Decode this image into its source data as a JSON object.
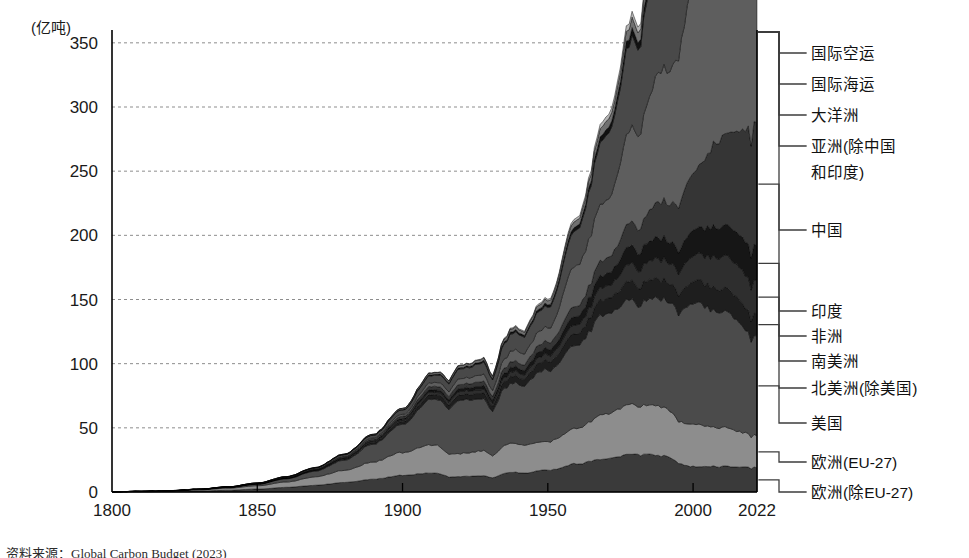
{
  "figure": {
    "unit_label": "(亿吨)",
    "source_note": "资料来源：Global Carbon Budget (2023)"
  },
  "chart_data": {
    "type": "area",
    "title": "",
    "subtitle": "",
    "xlabel": "",
    "ylabel": "",
    "unit": "亿吨",
    "grid": true,
    "stacked": true,
    "legend_position": "right",
    "xlim": [
      1800,
      2022
    ],
    "ylim": [
      0,
      360
    ],
    "ytick_values": [
      0,
      50,
      100,
      150,
      200,
      250,
      300,
      350
    ],
    "ytick_labels": [
      "0",
      "50",
      "100",
      "150",
      "200",
      "250",
      "300",
      "350"
    ],
    "xtick_values": [
      1800,
      1850,
      1900,
      1950,
      2000,
      2022
    ],
    "xtick_labels": [
      "1800",
      "1850",
      "1900",
      "1950",
      "2000",
      "2022"
    ],
    "x": [
      1800,
      1810,
      1820,
      1830,
      1840,
      1850,
      1860,
      1870,
      1880,
      1890,
      1900,
      1910,
      1920,
      1930,
      1940,
      1950,
      1960,
      1970,
      1980,
      1990,
      2000,
      2010,
      2022
    ],
    "series": [
      {
        "name": "欧洲(除EU-27)",
        "color": "#3a3a3a",
        "values": [
          0.1,
          0.2,
          0.4,
          0.8,
          1.4,
          2.3,
          3.6,
          5.2,
          7.5,
          10.0,
          13.0,
          15.0,
          12.0,
          13.0,
          15.5,
          17.0,
          22.0,
          26.0,
          30.0,
          28.0,
          20.0,
          20.0,
          19.0
        ]
      },
      {
        "name": "欧洲(EU-27)",
        "color": "#8d8d8d",
        "values": [
          0.1,
          0.2,
          0.4,
          0.9,
          1.6,
          2.6,
          4.2,
          6.5,
          9.5,
          13.5,
          18.0,
          22.0,
          18.0,
          20.0,
          23.0,
          22.0,
          28.0,
          35.0,
          39.0,
          38.0,
          33.0,
          30.0,
          25.0
        ]
      },
      {
        "name": "美国",
        "color": "#4b4b4b",
        "values": [
          0.0,
          0.1,
          0.2,
          0.3,
          0.6,
          1.2,
          2.5,
          4.5,
          8.0,
          14.0,
          22.0,
          35.0,
          42.0,
          40.0,
          48.0,
          56.0,
          65.0,
          78.0,
          82.0,
          85.0,
          95.0,
          90.0,
          78.0
        ]
      },
      {
        "name": "北美洲(除美国)",
        "color": "#1e1e1e",
        "values": [
          0.0,
          0.0,
          0.0,
          0.1,
          0.1,
          0.2,
          0.3,
          0.5,
          0.9,
          1.4,
          2.2,
          3.5,
          4.2,
          4.5,
          5.5,
          7.0,
          9.0,
          12.0,
          14.5,
          15.0,
          17.0,
          18.0,
          17.0
        ]
      },
      {
        "name": "南美洲",
        "color": "#2e2e2e",
        "values": [
          0.0,
          0.0,
          0.0,
          0.0,
          0.1,
          0.1,
          0.2,
          0.3,
          0.5,
          0.8,
          1.2,
          2.0,
          2.6,
          3.0,
          3.8,
          5.0,
          7.0,
          10.0,
          14.0,
          16.0,
          20.0,
          25.0,
          26.0
        ]
      },
      {
        "name": "非洲",
        "color": "#161616",
        "values": [
          0.0,
          0.0,
          0.0,
          0.0,
          0.0,
          0.1,
          0.1,
          0.2,
          0.4,
          0.7,
          1.1,
          1.8,
          2.3,
          2.8,
          3.5,
          4.5,
          6.5,
          9.5,
          14.0,
          16.5,
          20.0,
          24.0,
          27.0
        ]
      },
      {
        "name": "印度",
        "color": "#353535",
        "values": [
          0.0,
          0.0,
          0.0,
          0.0,
          0.1,
          0.1,
          0.2,
          0.4,
          0.7,
          1.1,
          1.8,
          2.6,
          3.2,
          3.5,
          4.5,
          5.5,
          8.0,
          12.0,
          19.0,
          29.0,
          45.0,
          70.0,
          95.0
        ]
      },
      {
        "name": "中国",
        "color": "#5e5e5e",
        "values": [
          0.0,
          0.0,
          0.0,
          0.0,
          0.0,
          0.1,
          0.2,
          0.3,
          0.5,
          0.9,
          1.5,
          3.0,
          4.5,
          5.5,
          9.0,
          11.0,
          32.0,
          45.0,
          75.0,
          105.0,
          145.0,
          270.0,
          310.0
        ]
      },
      {
        "name": "亚洲(除中国和印度)",
        "color": "#494949",
        "values": [
          0.0,
          0.0,
          0.1,
          0.1,
          0.2,
          0.3,
          0.5,
          0.8,
          1.3,
          2.1,
          3.4,
          5.5,
          7.5,
          9.5,
          14.0,
          16.0,
          28.0,
          50.0,
          70.0,
          95.0,
          120.0,
          150.0,
          165.0
        ]
      },
      {
        "name": "大洋洲",
        "color": "#111111",
        "values": [
          0.0,
          0.0,
          0.0,
          0.0,
          0.0,
          0.0,
          0.1,
          0.1,
          0.2,
          0.3,
          0.5,
          0.8,
          1.0,
          1.2,
          1.6,
          2.0,
          3.0,
          4.5,
          6.0,
          7.5,
          9.5,
          11.5,
          11.0
        ]
      },
      {
        "name": "国际海运",
        "color": "#707070",
        "values": [
          0.0,
          0.0,
          0.0,
          0.0,
          0.0,
          0.1,
          0.1,
          0.2,
          0.3,
          0.5,
          0.8,
          1.3,
          1.7,
          2.0,
          2.5,
          3.2,
          4.5,
          6.5,
          8.0,
          8.5,
          10.0,
          11.5,
          11.0
        ]
      },
      {
        "name": "国际空运",
        "color": "#b5b5b5",
        "values": [
          0.0,
          0.0,
          0.0,
          0.0,
          0.0,
          0.0,
          0.0,
          0.0,
          0.0,
          0.0,
          0.1,
          0.2,
          0.3,
          0.5,
          0.8,
          1.2,
          2.0,
          3.5,
          4.5,
          5.5,
          6.5,
          7.5,
          7.0
        ]
      }
    ],
    "legend_entries": [
      {
        "label": "国际空运"
      },
      {
        "label": "国际海运"
      },
      {
        "label": "大洋洲"
      },
      {
        "label": "亚洲(除中国和印度)"
      },
      {
        "label": "中国"
      },
      {
        "label": "印度"
      },
      {
        "label": "非洲"
      },
      {
        "label": "南美洲"
      },
      {
        "label": "北美洲(除美国)"
      },
      {
        "label": "美国"
      },
      {
        "label": "欧洲(EU-27)"
      },
      {
        "label": "欧洲(除EU-27)"
      }
    ]
  }
}
